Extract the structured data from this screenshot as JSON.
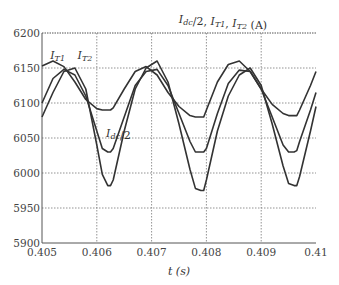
{
  "chart_data": {
    "type": "line",
    "xlabel": "t (s)",
    "ylabel": "",
    "xlim": [
      0.405,
      0.41
    ],
    "ylim": [
      5900,
      6200
    ],
    "xticks": [
      "0.405",
      "0.406",
      "0.407",
      "0.408",
      "0.409",
      "0.41"
    ],
    "yticks": [
      "5900",
      "5950",
      "6000",
      "6050",
      "6100",
      "6150",
      "6200"
    ],
    "grid": true,
    "annotations": [
      {
        "text": "I_T1",
        "x": 0.40515,
        "y": 6163
      },
      {
        "text": "I_T2",
        "x": 0.40565,
        "y": 6163
      },
      {
        "text": "I_dc/2",
        "x": 0.40617,
        "y": 6052
      }
    ],
    "series": [
      {
        "name": "I_dc/2",
        "x": [
          0.405,
          0.4052,
          0.4054,
          0.4056,
          0.4058,
          0.406,
          0.4061,
          0.4062,
          0.40625,
          0.4063,
          0.4065,
          0.4067,
          0.4069,
          0.4071,
          0.4073,
          0.4075,
          0.4077,
          0.4078,
          0.4079,
          0.40795,
          0.408,
          0.4082,
          0.4084,
          0.4086,
          0.4088,
          0.409,
          0.4092,
          0.4094,
          0.4095,
          0.4096,
          0.40965,
          0.4097,
          0.4099,
          0.41
        ],
        "y": [
          6100,
          6135,
          6148,
          6140,
          6110,
          6060,
          6035,
          6030,
          6030,
          6035,
          6080,
          6125,
          6145,
          6148,
          6125,
          6085,
          6045,
          6030,
          6030,
          6030,
          6035,
          6085,
          6128,
          6147,
          6145,
          6120,
          6080,
          6040,
          6030,
          6030,
          6032,
          6045,
          6090,
          6115
        ]
      },
      {
        "name": "I_T1",
        "x": [
          0.405,
          0.4052,
          0.4054,
          0.4056,
          0.4058,
          0.406,
          0.4061,
          0.4062,
          0.40625,
          0.4063,
          0.4065,
          0.4067,
          0.4069,
          0.4071,
          0.4073,
          0.4075,
          0.4077,
          0.4078,
          0.4079,
          0.40795,
          0.408,
          0.4082,
          0.4084,
          0.4086,
          0.4088,
          0.409,
          0.4092,
          0.4094,
          0.4095,
          0.4096,
          0.40965,
          0.4097,
          0.4099,
          0.41
        ],
        "y": [
          6153,
          6160,
          6152,
          6130,
          6105,
          6092,
          6090,
          6090,
          6090,
          6093,
          6120,
          6145,
          6152,
          6140,
          6115,
          6095,
          6082,
          6080,
          6080,
          6080,
          6090,
          6130,
          6155,
          6160,
          6145,
          6120,
          6098,
          6085,
          6082,
          6082,
          6082,
          6090,
          6125,
          6145
        ]
      },
      {
        "name": "I_T2",
        "x": [
          0.405,
          0.4052,
          0.4054,
          0.4056,
          0.4058,
          0.406,
          0.4061,
          0.4062,
          0.40625,
          0.4063,
          0.4065,
          0.4067,
          0.4069,
          0.4071,
          0.4073,
          0.4075,
          0.4077,
          0.4078,
          0.4079,
          0.40795,
          0.408,
          0.4082,
          0.4084,
          0.4086,
          0.4088,
          0.409,
          0.4092,
          0.4094,
          0.4095,
          0.4096,
          0.40965,
          0.4097,
          0.4099,
          0.41
        ],
        "y": [
          6080,
          6115,
          6145,
          6150,
          6120,
          6040,
          5998,
          5982,
          5982,
          5990,
          6060,
          6120,
          6150,
          6160,
          6130,
          6070,
          6005,
          5978,
          5975,
          5975,
          5990,
          6060,
          6110,
          6140,
          6150,
          6125,
          6070,
          6010,
          5985,
          5982,
          5982,
          5995,
          6060,
          6095
        ]
      }
    ]
  }
}
